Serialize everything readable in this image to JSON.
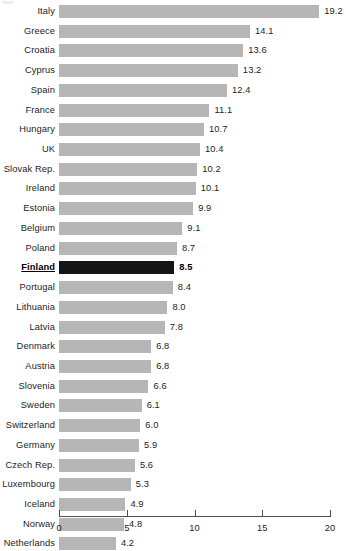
{
  "chart_data": {
    "type": "bar",
    "orientation": "horizontal",
    "title": "",
    "subtitle": "",
    "xlabel": "",
    "ylabel": "",
    "xlim": [
      0,
      20
    ],
    "xticks": [
      0,
      5,
      10,
      15,
      20
    ],
    "xtick_labels": [
      "0",
      "5",
      "10",
      "15",
      "20"
    ],
    "grid": false,
    "legend": null,
    "bar_color": "#b6b6b6",
    "highlight_color": "#161616",
    "highlight_category": "Finland",
    "categories": [
      "Italy",
      "Greece",
      "Croatia",
      "Cyprus",
      "Spain",
      "France",
      "Hungary",
      "UK",
      "Slovak Rep.",
      "Ireland",
      "Estonia",
      "Belgium",
      "Poland",
      "Finland",
      "Portugal",
      "Lithuania",
      "Latvia",
      "Denmark",
      "Austria",
      "Slovenia",
      "Sweden",
      "Switzerland",
      "Germany",
      "Czech Rep.",
      "Luxembourg",
      "Iceland",
      "Norway",
      "Netherlands"
    ],
    "values": [
      19.2,
      14.1,
      13.6,
      13.2,
      12.4,
      11.1,
      10.7,
      10.4,
      10.2,
      10.1,
      9.9,
      9.1,
      8.7,
      8.5,
      8.4,
      8.0,
      7.8,
      6.8,
      6.8,
      6.6,
      6.1,
      6.0,
      5.9,
      5.6,
      5.3,
      4.9,
      4.8,
      4.2
    ],
    "value_labels": [
      "19.2",
      "14.1",
      "13.6",
      "13.2",
      "12.4",
      "11.1",
      "10.7",
      "10.4",
      "10.2",
      "10.1",
      "9.9",
      "9.1",
      "8.7",
      "8.5",
      "8.4",
      "8.0",
      "7.8",
      "6.8",
      "6.8",
      "6.6",
      "6.1",
      "6.0",
      "5.9",
      "5.6",
      "5.3",
      "4.9",
      "4.8",
      "4.2"
    ]
  }
}
